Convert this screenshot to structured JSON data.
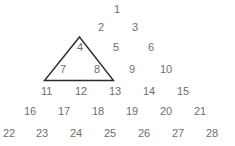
{
  "canvas": {
    "width": 235,
    "height": 146,
    "background_color": "#ffffff"
  },
  "figure": {
    "title": "",
    "number_color": "#6e6e6e",
    "outline_color": "#2b2b2b",
    "outline_width": 1.4,
    "rows": [
      {
        "row": 1,
        "numbers": [
          {
            "label": "1",
            "x": 114,
            "y": 4
          }
        ]
      },
      {
        "row": 2,
        "numbers": [
          {
            "label": "2",
            "x": 98,
            "y": 22
          },
          {
            "label": "3",
            "x": 132,
            "y": 22
          }
        ]
      },
      {
        "row": 3,
        "numbers": [
          {
            "label": "4",
            "x": 77,
            "y": 42
          },
          {
            "label": "5",
            "x": 113,
            "y": 42
          },
          {
            "label": "6",
            "x": 148,
            "y": 42
          }
        ]
      },
      {
        "row": 4,
        "numbers": [
          {
            "label": "7",
            "x": 60,
            "y": 64
          },
          {
            "label": "8",
            "x": 94,
            "y": 64
          },
          {
            "label": "9",
            "x": 129,
            "y": 64
          },
          {
            "label": "10",
            "x": 160,
            "y": 64
          }
        ]
      },
      {
        "row": 5,
        "numbers": [
          {
            "label": "11",
            "x": 41,
            "y": 86
          },
          {
            "label": "12",
            "x": 75,
            "y": 86
          },
          {
            "label": "13",
            "x": 109,
            "y": 86
          },
          {
            "label": "14",
            "x": 143,
            "y": 86
          },
          {
            "label": "15",
            "x": 177,
            "y": 86
          }
        ]
      },
      {
        "row": 6,
        "numbers": [
          {
            "label": "16",
            "x": 24,
            "y": 106
          },
          {
            "label": "17",
            "x": 58,
            "y": 106
          },
          {
            "label": "18",
            "x": 92,
            "y": 106
          },
          {
            "label": "19",
            "x": 126,
            "y": 106
          },
          {
            "label": "20",
            "x": 160,
            "y": 106
          },
          {
            "label": "21",
            "x": 194,
            "y": 106
          }
        ]
      },
      {
        "row": 7,
        "numbers": [
          {
            "label": "22",
            "x": 3,
            "y": 128
          },
          {
            "label": "23",
            "x": 36,
            "y": 128
          },
          {
            "label": "24",
            "x": 70,
            "y": 128
          },
          {
            "label": "25",
            "x": 104,
            "y": 128
          },
          {
            "label": "26",
            "x": 138,
            "y": 128
          },
          {
            "label": "27",
            "x": 172,
            "y": 128
          },
          {
            "label": "28",
            "x": 206,
            "y": 128
          }
        ]
      }
    ],
    "triangle_outline": {
      "points": "79.5,37 113.5,80.5 44.5,80.5",
      "apex": {
        "x": 79.5,
        "y": 37
      },
      "bottom_right": {
        "x": 113.5,
        "y": 80.5
      },
      "bottom_left": {
        "x": 44.5,
        "y": 80.5
      },
      "enclosed_numbers": [
        "4",
        "7",
        "8"
      ]
    }
  }
}
